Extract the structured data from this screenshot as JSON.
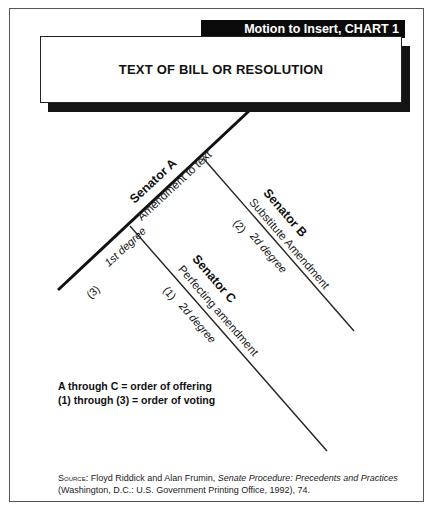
{
  "chart": {
    "title_bar": "Motion to Insert, CHART 1",
    "main_box": "TEXT OF BILL OR RESOLUTION"
  },
  "branches": {
    "a": {
      "senator": "Senator A",
      "amendment": "Amendment to text",
      "degree": "1st degree",
      "vote_order": "(3)"
    },
    "b": {
      "senator": "Senator B",
      "amendment": "Substitute Amendment",
      "degree": "2d degree",
      "vote_order": "(2)"
    },
    "c": {
      "senator": "Senator C",
      "amendment": "Perfecting amendment",
      "degree": "2d degree",
      "vote_order": "(1)"
    }
  },
  "legend": {
    "line1": "A through C = order of offering",
    "line2": "(1) through (3) = order of voting"
  },
  "source": {
    "label": "Source:",
    "authors": " Floyd Riddick and Alan Frumin, ",
    "title": "Senate Procedure: Precedents and Practices",
    "details": "(Washington, D.C.: U.S. Government Printing Office, 1992), 74."
  },
  "colors": {
    "ink": "#111111",
    "title_bar_bg": "#0a0a0a",
    "title_bar_text": "#ffffff",
    "frame": "#555555"
  }
}
